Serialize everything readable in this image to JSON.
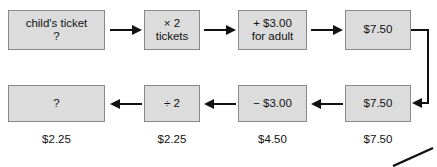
{
  "diagram": {
    "colors": {
      "box_fill": "#dcdcdc",
      "box_border": "#8a8a8a",
      "text": "#111111",
      "arrow": "#111111",
      "background": "#ffffff"
    },
    "top_row": [
      {
        "id": "childs-ticket",
        "lines": [
          "child's ticket",
          "?"
        ]
      },
      {
        "id": "times-two-tickets",
        "lines": [
          "× 2",
          "tickets"
        ]
      },
      {
        "id": "plus-three-for-adult",
        "lines": [
          "+ $3.00",
          "for adult"
        ]
      },
      {
        "id": "top-total",
        "lines": [
          "$7.50"
        ]
      }
    ],
    "bottom_row": [
      {
        "id": "unknown-result",
        "lines": [
          "?"
        ]
      },
      {
        "id": "divide-two",
        "lines": [
          "÷ 2"
        ]
      },
      {
        "id": "minus-three",
        "lines": [
          "− $3.00"
        ]
      },
      {
        "id": "bottom-total",
        "lines": [
          "$7.50"
        ]
      }
    ],
    "captions": [
      "$2.25",
      "$2.25",
      "$4.50",
      "$7.50"
    ],
    "arrows": {
      "top_direction": "right",
      "bottom_direction": "left",
      "wrap_connector": "from top-right box around to bottom-right box"
    }
  }
}
